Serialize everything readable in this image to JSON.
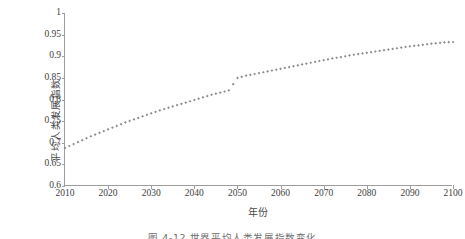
{
  "figure": {
    "caption": "图 4-12  世界平均人类发展指数变化",
    "series_color": "#8a8a8a",
    "axis_color": "#9d9d9d"
  },
  "chart_data": {
    "type": "line",
    "title": "",
    "xlabel": "年份",
    "ylabel": "平均人类发展指数",
    "xlim": [
      2010,
      2100
    ],
    "ylim": [
      0.6,
      1
    ],
    "grid": false,
    "legend": "none",
    "marker": "small-diamond",
    "xtick_labels": [
      "2010",
      "2020",
      "2030",
      "2040",
      "2050",
      "2060",
      "2070",
      "2080",
      "2090",
      "2100"
    ],
    "xticks": [
      2010,
      2020,
      2030,
      2040,
      2050,
      2060,
      2070,
      2080,
      2090,
      2100
    ],
    "ytick_labels": [
      "1",
      "0.95",
      "0.9",
      "0.85",
      "0.8",
      "0.75",
      "0.7",
      "0.65",
      "0.6"
    ],
    "yticks": [
      1,
      0.95,
      0.9,
      0.85,
      0.8,
      0.75,
      0.7,
      0.65,
      0.6
    ],
    "series": [
      {
        "name": "平均人类发展指数",
        "x": [
          2010,
          2012,
          2014,
          2016,
          2018,
          2020,
          2022,
          2024,
          2026,
          2028,
          2030,
          2032,
          2034,
          2036,
          2038,
          2040,
          2042,
          2044,
          2046,
          2048,
          2050,
          2052,
          2054,
          2056,
          2058,
          2060,
          2062,
          2064,
          2066,
          2068,
          2070,
          2072,
          2074,
          2076,
          2078,
          2080,
          2082,
          2084,
          2086,
          2088,
          2090,
          2092,
          2094,
          2096,
          2098,
          2100
        ],
        "values": [
          0.688,
          0.697,
          0.706,
          0.715,
          0.723,
          0.731,
          0.739,
          0.747,
          0.754,
          0.761,
          0.768,
          0.775,
          0.781,
          0.787,
          0.793,
          0.799,
          0.805,
          0.811,
          0.816,
          0.821,
          0.85,
          0.855,
          0.859,
          0.863,
          0.867,
          0.871,
          0.875,
          0.879,
          0.883,
          0.887,
          0.891,
          0.895,
          0.898,
          0.902,
          0.905,
          0.908,
          0.911,
          0.914,
          0.917,
          0.92,
          0.923,
          0.925,
          0.928,
          0.93,
          0.932,
          0.933
        ]
      }
    ]
  }
}
